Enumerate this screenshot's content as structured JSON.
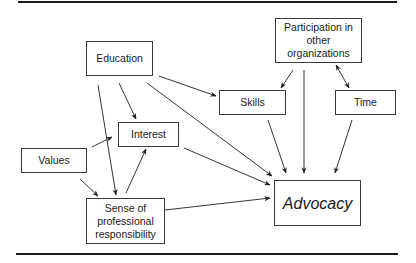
{
  "diagram": {
    "type": "path-model",
    "nodes": {
      "education": {
        "label": "Education"
      },
      "participation": {
        "label": "Participation in\nother\norganizations"
      },
      "skills": {
        "label": "Skills"
      },
      "time": {
        "label": "Time"
      },
      "interest": {
        "label": "Interest"
      },
      "values": {
        "label": "Values"
      },
      "sense": {
        "label": "Sense of\nprofessional\nresponsibility"
      },
      "advocacy": {
        "label": "Advocacy"
      }
    },
    "edges": [
      {
        "from": "Education",
        "to": "Skills"
      },
      {
        "from": "Education",
        "to": "Interest"
      },
      {
        "from": "Education",
        "to": "Sense of professional responsibility"
      },
      {
        "from": "Education",
        "to": "Advocacy"
      },
      {
        "from": "Values",
        "to": "Interest"
      },
      {
        "from": "Values",
        "to": "Sense of professional responsibility"
      },
      {
        "from": "Sense of professional responsibility",
        "to": "Interest"
      },
      {
        "from": "Interest",
        "to": "Advocacy"
      },
      {
        "from": "Sense of professional responsibility",
        "to": "Advocacy"
      },
      {
        "from": "Participation in other organizations",
        "to": "Skills"
      },
      {
        "from": "Participation in other organizations",
        "to": "Advocacy"
      },
      {
        "from": "Participation in other organizations",
        "to": "Time",
        "bidirectional": true
      },
      {
        "from": "Skills",
        "to": "Advocacy"
      },
      {
        "from": "Time",
        "to": "Advocacy"
      }
    ],
    "colors": {
      "line": "#1e1e1e",
      "border": "#3a3a3a",
      "background": "#ffffff"
    }
  }
}
